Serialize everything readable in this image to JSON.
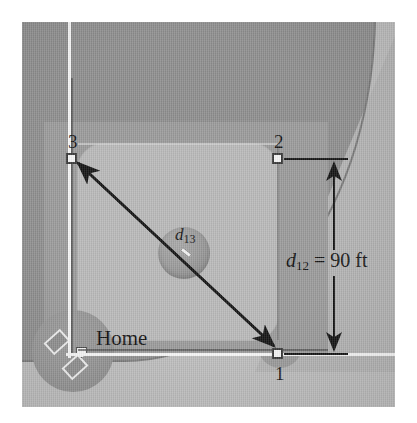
{
  "figure": {
    "type": "baseball-diamond-diagram"
  },
  "bases": [
    {
      "id": "home",
      "label": "Home",
      "name": "home-plate"
    },
    {
      "id": "first",
      "label": "1",
      "name": "first-base"
    },
    {
      "id": "second",
      "label": "2",
      "name": "second-base"
    },
    {
      "id": "third",
      "label": "3",
      "name": "third-base"
    }
  ],
  "dimensions": {
    "d12": {
      "symbol": "d",
      "subscript": "12",
      "equals": "=",
      "value": "90",
      "unit": "ft",
      "full_text": "d12 = 90 ft"
    },
    "d13": {
      "symbol": "d",
      "subscript": "13",
      "full_text": "d13"
    }
  },
  "field_features": [
    {
      "name": "outfield-arc",
      "description": "outfield boundary arc"
    },
    {
      "name": "infield-grass",
      "description": "infield grass diamond"
    },
    {
      "name": "pitchers-mound",
      "description": "pitcher's mound with rubber"
    },
    {
      "name": "foul-line-left",
      "description": "third-base foul line"
    },
    {
      "name": "foul-line-right",
      "description": "first-base foul line"
    },
    {
      "name": "batters-box-left",
      "description": "left batter's box"
    },
    {
      "name": "batters-box-right",
      "description": "right batter's box"
    }
  ],
  "colors": {
    "outfield": "#8e8e8e",
    "infield_dirt": "#9a9a9a",
    "infield_grass": "#b9b9b9",
    "foul_ground": "#bcbcbc",
    "chalk_line": "#f6f6f6",
    "ink": "#141414"
  }
}
